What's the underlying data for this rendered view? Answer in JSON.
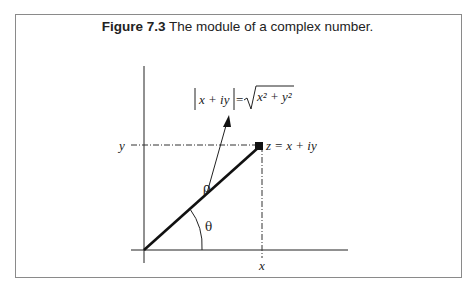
{
  "caption": {
    "label": "Figure 7.3",
    "text": " The module of a complex number."
  },
  "diagram": {
    "formula_lhs": "x + iy",
    "formula_eq": "=",
    "formula_rad": "x² + y²",
    "point_label": "z = x + iy",
    "y_label": "y",
    "x_label": "x",
    "rho_label": "ρ",
    "theta_label": "θ"
  },
  "colors": {
    "line": "#111111",
    "frame": "#8a8a8a"
  }
}
